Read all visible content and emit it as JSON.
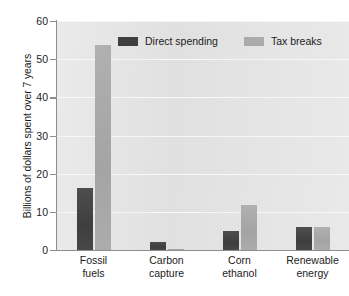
{
  "chart_data": {
    "type": "bar",
    "title": "",
    "subtitle": "",
    "xlabel": "",
    "ylabel": "Billions of dollars spent over 7 years",
    "ylim": [
      0,
      60
    ],
    "yticks": [
      0,
      10,
      20,
      30,
      40,
      50,
      60
    ],
    "ytick_labels": [
      "0",
      "10",
      "20",
      "30",
      "40",
      "50",
      "60"
    ],
    "grid": true,
    "grid_axis": "y",
    "legend_position": "top",
    "categories": [
      "Fossil fuels",
      "Carbon capture",
      "Corn ethanol",
      "Renewable energy"
    ],
    "category_lines": [
      [
        "Fossil",
        "fuels"
      ],
      [
        "Carbon",
        "capture"
      ],
      [
        "Corn",
        "ethanol"
      ],
      [
        "Renewable",
        "energy"
      ]
    ],
    "series": [
      {
        "name": "Direct spending",
        "color": "#3f3f3f",
        "values": [
          16.2,
          2.2,
          5.0,
          6.0
        ]
      },
      {
        "name": "Tax breaks",
        "color": "#ababab",
        "values": [
          53.7,
          0.3,
          11.8,
          6.1
        ]
      }
    ]
  },
  "colors": {
    "plot_background": "#e4e4e4",
    "gridline": "#f7f7f7",
    "axis": "#8d8d8d",
    "text": "#1c1c1c",
    "direct_spending": "#3f3f3f",
    "tax_breaks": "#ababab"
  }
}
